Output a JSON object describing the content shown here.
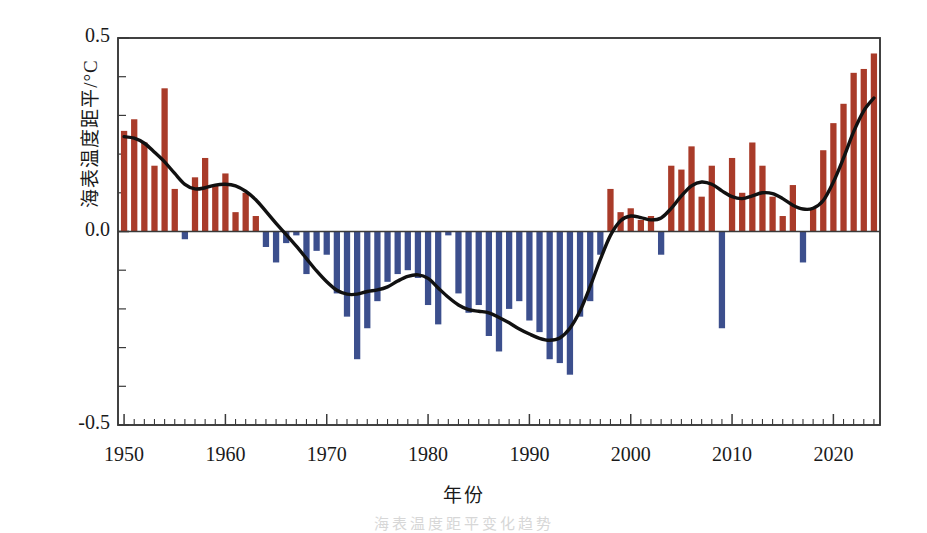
{
  "figure": {
    "ylabel": "海表温度距平/°C",
    "xlabel": "年份",
    "ghost_caption": "海表温度距平变化趋势"
  },
  "colors": {
    "positive_bar": "#a93b29",
    "negative_bar": "#3c4f8d",
    "smooth_line": "#111111",
    "axis": "#3a3a3a",
    "background": "#ffffff"
  },
  "axes": {
    "y_ticks_major": [
      "0.5",
      "0.0",
      "-0.5"
    ],
    "y_tick_values": [
      0.5,
      0.0,
      -0.5
    ],
    "y_minor_count": 10,
    "x_ticks_major": [
      "1950",
      "1960",
      "1970",
      "1980",
      "1990",
      "2000",
      "2010",
      "2020"
    ],
    "x_tick_values": [
      1950,
      1960,
      1970,
      1980,
      1990,
      2000,
      2010,
      2020
    ],
    "x_minor_step": 1
  },
  "chart_data": {
    "type": "bar",
    "title": "",
    "subtitle": "",
    "xlabel": "年份",
    "ylabel": "海表温度距平/°C",
    "xlim": [
      1949.4,
      2024.6
    ],
    "ylim": [
      -0.5,
      0.5
    ],
    "grid": false,
    "legend": null,
    "annotations": [],
    "x": [
      1950,
      1951,
      1952,
      1953,
      1954,
      1955,
      1956,
      1957,
      1958,
      1959,
      1960,
      1961,
      1962,
      1963,
      1964,
      1965,
      1966,
      1967,
      1968,
      1969,
      1970,
      1971,
      1972,
      1973,
      1974,
      1975,
      1976,
      1977,
      1978,
      1979,
      1980,
      1981,
      1982,
      1983,
      1984,
      1985,
      1986,
      1987,
      1988,
      1989,
      1990,
      1991,
      1992,
      1993,
      1994,
      1995,
      1996,
      1997,
      1998,
      1999,
      2000,
      2001,
      2002,
      2003,
      2004,
      2005,
      2006,
      2007,
      2008,
      2009,
      2010,
      2011,
      2012,
      2013,
      2014,
      2015,
      2016,
      2017,
      2018,
      2019,
      2020,
      2021,
      2022,
      2023,
      2024
    ],
    "series": [
      {
        "name": "海表温度距平",
        "type": "bar",
        "values": [
          0.26,
          0.29,
          0.23,
          0.17,
          0.37,
          0.11,
          -0.02,
          0.14,
          0.19,
          0.12,
          0.15,
          0.05,
          0.1,
          0.04,
          -0.04,
          -0.08,
          -0.03,
          -0.01,
          -0.11,
          -0.05,
          -0.06,
          -0.16,
          -0.22,
          -0.33,
          -0.25,
          -0.18,
          -0.13,
          -0.11,
          -0.1,
          -0.12,
          -0.19,
          -0.24,
          -0.01,
          -0.16,
          -0.21,
          -0.19,
          -0.27,
          -0.31,
          -0.2,
          -0.18,
          -0.23,
          -0.26,
          -0.33,
          -0.34,
          -0.37,
          -0.22,
          -0.18,
          -0.06,
          0.11,
          0.05,
          0.06,
          0.03,
          0.04,
          -0.06,
          0.17,
          0.16,
          0.22,
          0.09,
          0.17,
          -0.25,
          0.19,
          0.1,
          0.23,
          0.17,
          0.09,
          0.04,
          0.12,
          -0.08,
          0.06,
          0.21,
          0.28,
          0.33,
          0.41,
          0.42,
          0.46
        ]
      },
      {
        "name": "平滑曲线",
        "type": "line",
        "values": [
          0.245,
          0.241,
          0.228,
          0.205,
          0.18,
          0.15,
          0.122,
          0.11,
          0.113,
          0.12,
          0.122,
          0.118,
          0.104,
          0.082,
          0.052,
          0.021,
          -0.008,
          -0.038,
          -0.07,
          -0.102,
          -0.13,
          -0.152,
          -0.162,
          -0.162,
          -0.155,
          -0.151,
          -0.143,
          -0.128,
          -0.116,
          -0.112,
          -0.121,
          -0.146,
          -0.17,
          -0.19,
          -0.202,
          -0.206,
          -0.21,
          -0.222,
          -0.236,
          -0.252,
          -0.265,
          -0.276,
          -0.281,
          -0.275,
          -0.25,
          -0.205,
          -0.142,
          -0.072,
          -0.01,
          0.028,
          0.04,
          0.036,
          0.03,
          0.035,
          0.06,
          0.092,
          0.118,
          0.128,
          0.122,
          0.105,
          0.09,
          0.085,
          0.092,
          0.1,
          0.098,
          0.085,
          0.068,
          0.058,
          0.06,
          0.08,
          0.128,
          0.19,
          0.258,
          0.312,
          0.345
        ]
      }
    ]
  }
}
